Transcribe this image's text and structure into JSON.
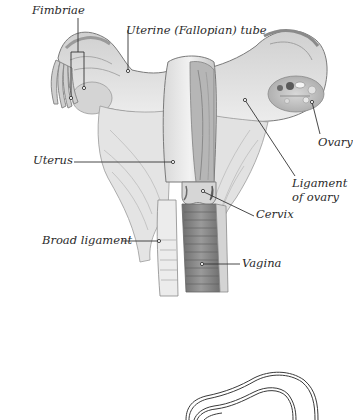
{
  "diagram": {
    "labels": {
      "fimbriae": "Fimbriae",
      "fallopian_tube": "Uterine (Fallopian) tube",
      "ovary": "Ovary",
      "uterus": "Uterus",
      "ligament_of_ovary_line1": "Ligament",
      "ligament_of_ovary_line2": "of ovary",
      "cervix": "Cervix",
      "broad_ligament": "Broad ligament",
      "vagina": "Vagina"
    },
    "colors": {
      "background": "#ffffff",
      "tissue_light": "#e6e6e6",
      "tissue_mid": "#bdbdbd",
      "tissue_dark": "#8a8a8a",
      "vaginal_canal": "#7a7a7a",
      "leader_line": "#333333",
      "outline_stroke": "#3a3a3a"
    }
  }
}
